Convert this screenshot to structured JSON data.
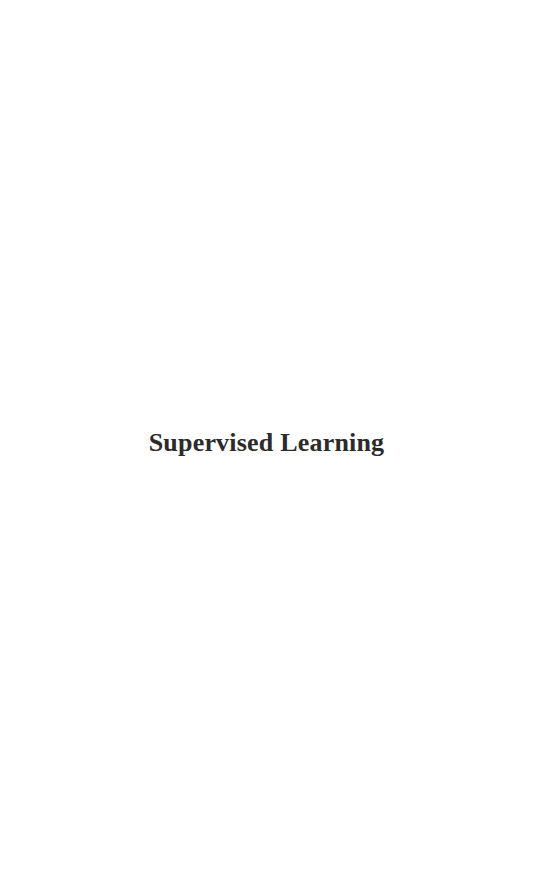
{
  "page": {
    "title": "Supervised Learning"
  }
}
